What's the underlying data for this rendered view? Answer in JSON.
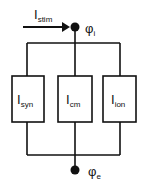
{
  "diagram": {
    "type": "equivalent-circuit",
    "input_current": {
      "base": "I",
      "sub": "stim"
    },
    "top_node": {
      "base": "φ",
      "sub": "i"
    },
    "bottom_node": {
      "base": "φ",
      "sub": "e"
    },
    "branches": [
      {
        "base": "I",
        "sub": "syn"
      },
      {
        "base": "I",
        "sub": "cm"
      },
      {
        "base": "I",
        "sub": "ion"
      }
    ],
    "colors": {
      "line": "#111111",
      "background": "#ffffff"
    }
  }
}
